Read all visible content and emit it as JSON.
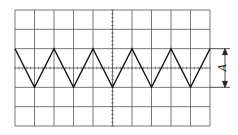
{
  "diagram": {
    "type": "oscilloscope-screen",
    "grid": {
      "columns": 10,
      "rows": 6,
      "left": 15,
      "top": 10,
      "right": 210,
      "bottom": 126
    },
    "waveform": {
      "shape": "triangle",
      "period_divisions": 2,
      "peak_row": 2,
      "trough_row": 4,
      "cycles": 5
    },
    "amplitude_marker": {
      "label": "A",
      "from_row": 2,
      "to_row": 4
    },
    "colors": {
      "grid": "#555555",
      "wave": "#111111",
      "background": "#ffffff"
    }
  }
}
